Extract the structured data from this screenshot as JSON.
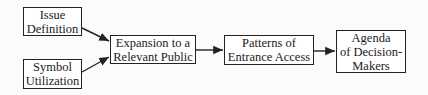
{
  "diagram": {
    "nodes": [
      {
        "id": "issue",
        "lines": [
          "Issue",
          "Definition"
        ]
      },
      {
        "id": "symbol",
        "lines": [
          "Symbol",
          "Utilization"
        ]
      },
      {
        "id": "expansion",
        "lines": [
          "Expansion to a",
          "Relevant Public"
        ]
      },
      {
        "id": "patterns",
        "lines": [
          "Patterns of",
          "Entrance Access"
        ]
      },
      {
        "id": "agenda",
        "lines": [
          "Agenda",
          "of Decision-",
          "Makers"
        ]
      }
    ],
    "edges": [
      {
        "from": "issue",
        "to": "expansion"
      },
      {
        "from": "symbol",
        "to": "expansion"
      },
      {
        "from": "expansion",
        "to": "patterns"
      },
      {
        "from": "patterns",
        "to": "agenda"
      }
    ]
  }
}
